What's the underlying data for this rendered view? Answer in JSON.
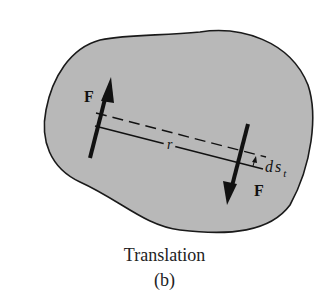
{
  "figure": {
    "caption": "Translation",
    "sublabel": "(b)",
    "colors": {
      "body_fill": "#b8b8b8",
      "outline": "#1a1a1a",
      "ink": "#111111"
    },
    "labels": {
      "force_left": "F",
      "force_right": "F",
      "radius": "r",
      "displacement_main": "ds",
      "displacement_sub": "t"
    },
    "elements": [
      {
        "type": "rigid-body",
        "description": "irregular gray blob outline"
      },
      {
        "type": "force-arrow",
        "label": "F",
        "direction": "up",
        "position": "left"
      },
      {
        "type": "force-arrow",
        "label": "F",
        "direction": "down",
        "position": "right"
      },
      {
        "type": "line",
        "style": "solid",
        "label": "r"
      },
      {
        "type": "line",
        "style": "dashed"
      },
      {
        "type": "dimension",
        "label": "ds_t"
      }
    ]
  }
}
